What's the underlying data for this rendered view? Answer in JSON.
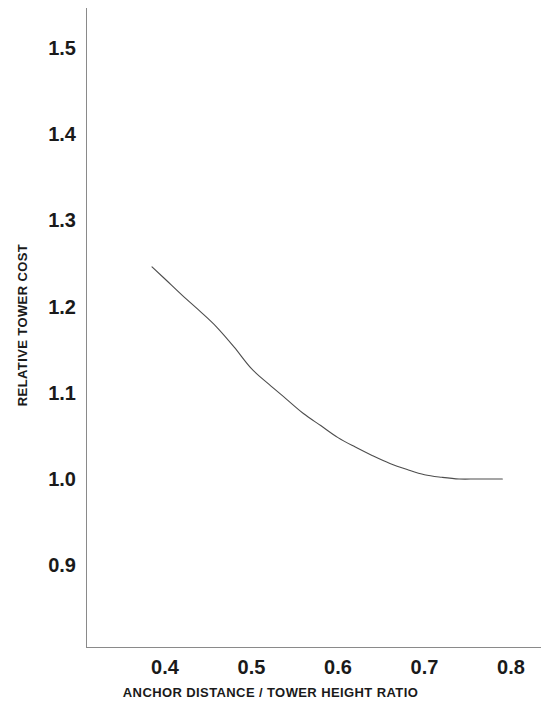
{
  "chart_data": {
    "type": "line",
    "title": "",
    "xlabel": "ANCHOR DISTANCE / TOWER HEIGHT RATIO",
    "ylabel": "RELATIVE TOWER COST",
    "xlim": [
      0.335,
      0.865
    ],
    "ylim": [
      0.845,
      1.545
    ],
    "xticks": [
      "0.4",
      "0.5",
      "0.6",
      "0.7",
      "0.8"
    ],
    "xtick_values": [
      0.4,
      0.5,
      0.6,
      0.7,
      0.8
    ],
    "yticks": [
      "0.9",
      "1.0",
      "1.1",
      "1.2",
      "1.3",
      "1.4",
      "1.5"
    ],
    "ytick_values": [
      0.9,
      1.0,
      1.1,
      1.2,
      1.3,
      1.4,
      1.5
    ],
    "grid": false,
    "legend": "none",
    "line_color": "#4d4d4d",
    "background_color": "#ffffff",
    "series": [
      {
        "name": "relative tower cost",
        "x": [
          0.385,
          0.4,
          0.42,
          0.44,
          0.46,
          0.48,
          0.5,
          0.52,
          0.54,
          0.56,
          0.58,
          0.6,
          0.62,
          0.64,
          0.66,
          0.68,
          0.7,
          0.72,
          0.74,
          0.76,
          0.78,
          0.79
        ],
        "values": [
          1.246,
          1.232,
          1.213,
          1.195,
          1.176,
          1.153,
          1.128,
          1.11,
          1.093,
          1.076,
          1.062,
          1.048,
          1.037,
          1.027,
          1.018,
          1.011,
          1.005,
          1.002,
          1.0,
          1.0,
          1.0,
          1.0
        ]
      }
    ]
  }
}
